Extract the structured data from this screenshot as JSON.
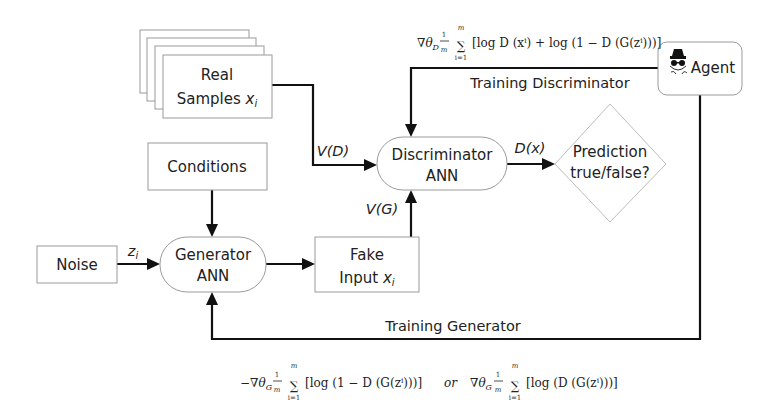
{
  "diagram": {
    "type": "flowchart",
    "nodes": {
      "real_samples": {
        "line1": "Real",
        "line2": "Samples ",
        "var": "x",
        "sub": "i"
      },
      "conditions": {
        "label": "Conditions"
      },
      "noise": {
        "label": "Noise"
      },
      "generator": {
        "line1": "Generator",
        "line2": "ANN"
      },
      "fake_input": {
        "line1": "Fake",
        "line2": "Input ",
        "var": "x",
        "sub": "i"
      },
      "discriminator": {
        "line1": "Discriminator",
        "line2": "ANN"
      },
      "prediction": {
        "line1": "Prediction",
        "line2": "true/false?"
      },
      "agent": {
        "label": "Agent",
        "icon": "spy-agent-icon"
      }
    },
    "edge_labels": {
      "v_d": "V(D)",
      "v_g": "V(G)",
      "d_x": "D(x)",
      "z_i_var": "z",
      "z_i_sub": "i",
      "training_discriminator": "Training Discriminator",
      "training_generator": "Training Generator"
    },
    "formulas": {
      "discriminator_update": {
        "prefix": "∇θ",
        "prefix_sub": "D",
        "frac_num": "1",
        "frac_den": "m",
        "sum_top": "m",
        "sum_bottom": "i=1",
        "body": "[log D (xⁱ) + log (1 − D (G(zⁱ)))]"
      },
      "generator_update_a": {
        "prefix": "−∇θ",
        "prefix_sub": "G",
        "frac_num": "1",
        "frac_den": "m",
        "sum_top": "m",
        "sum_bottom": "i=1",
        "body": "[log (1 − D (G(zⁱ)))]"
      },
      "connector": "or",
      "generator_update_b": {
        "prefix": "∇θ",
        "prefix_sub": "G",
        "frac_num": "1",
        "frac_den": "m",
        "sum_top": "m",
        "sum_bottom": "i=1",
        "body": "[log (D (G(zⁱ)))]"
      }
    },
    "colors": {
      "line": "#111111",
      "box_border": "#9a9a9a",
      "diamond_border": "#bdbdbd",
      "background": "#ffffff",
      "text": "#222222"
    }
  }
}
